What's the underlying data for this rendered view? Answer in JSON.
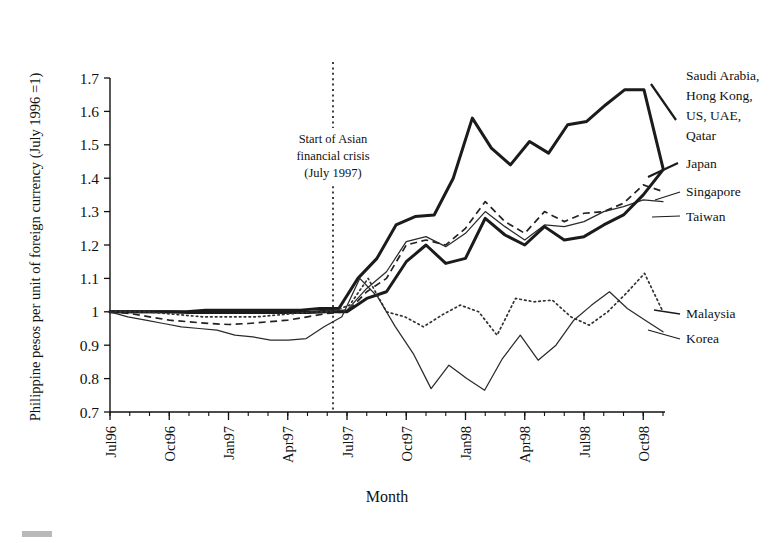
{
  "chart_data": {
    "type": "line",
    "title": "",
    "xlabel": "Month",
    "ylabel": "Philippine pesos per unit of foreign currency (July 1996 =1)",
    "ylim": [
      0.7,
      1.7
    ],
    "ytick_labels": [
      "0.7",
      "0.8",
      "0.9",
      "1",
      "1.1",
      "1.2",
      "1.3",
      "1.4",
      "1.5",
      "1.6",
      "1.7"
    ],
    "ytick_values": [
      0.7,
      0.8,
      0.9,
      1.0,
      1.1,
      1.2,
      1.3,
      1.4,
      1.5,
      1.6,
      1.7
    ],
    "xtick_labels": [
      "Jul96",
      "Oct96",
      "Jan97",
      "Apr97",
      "Jul97",
      "Oct97",
      "Jan98",
      "Apr98",
      "Jul98",
      "Oct98"
    ],
    "xtick_indices": [
      0,
      3,
      6,
      9,
      12,
      15,
      18,
      21,
      24,
      27
    ],
    "x_count": 28,
    "grid": false,
    "legend_position": "right-inline",
    "annotations": [
      {
        "name": "crisis-marker",
        "lines": [
          "Start of Asian",
          "financial crisis",
          "(July 1997)"
        ],
        "x_index": 11.7,
        "style": "vertical-dotted-line"
      }
    ],
    "series": [
      {
        "name": "Saudi Arabia, Hong Kong, US, UAE, Qatar",
        "label_lines": [
          "Saudi Arabia,",
          "Hong Kong,",
          "US, UAE,",
          "Qatar"
        ],
        "style": "thick-solid",
        "values": [
          1.0,
          1.0,
          1.0,
          1.0,
          1.0,
          1.005,
          1.005,
          1.005,
          1.005,
          1.005,
          1.005,
          1.01,
          1.01,
          1.1,
          1.16,
          1.26,
          1.285,
          1.29,
          1.4,
          1.58,
          1.49,
          1.44,
          1.51,
          1.475,
          1.56,
          1.57,
          1.62,
          1.665,
          1.665,
          1.43
        ]
      },
      {
        "name": "Japan",
        "label_lines": [
          "Japan"
        ],
        "style": "dashed",
        "values": [
          1.0,
          0.995,
          0.985,
          0.975,
          0.97,
          0.965,
          0.962,
          0.965,
          0.97,
          0.975,
          0.985,
          0.995,
          1.0,
          1.06,
          1.1,
          1.2,
          1.215,
          1.2,
          1.25,
          1.33,
          1.27,
          1.235,
          1.3,
          1.27,
          1.295,
          1.3,
          1.325,
          1.38,
          1.36
        ]
      },
      {
        "name": "Singapore",
        "label_lines": [
          "Singapore"
        ],
        "style": "thin-solid",
        "values": [
          1.0,
          1.0,
          1.0,
          1.0,
          1.0,
          1.0,
          1.0,
          1.0,
          1.0,
          1.0,
          1.0,
          1.005,
          1.005,
          1.07,
          1.12,
          1.21,
          1.225,
          1.195,
          1.235,
          1.3,
          1.255,
          1.215,
          1.26,
          1.255,
          1.27,
          1.3,
          1.315,
          1.335,
          1.33
        ]
      },
      {
        "name": "Taiwan",
        "label_lines": [
          "Taiwan"
        ],
        "style": "thick-solid",
        "values": [
          1.0,
          1.0,
          1.0,
          1.0,
          0.998,
          0.998,
          0.998,
          0.998,
          0.998,
          0.998,
          0.998,
          1.0,
          1.0,
          1.04,
          1.06,
          1.15,
          1.2,
          1.145,
          1.16,
          1.28,
          1.23,
          1.2,
          1.255,
          1.215,
          1.225,
          1.26,
          1.29,
          1.35,
          1.425
        ]
      },
      {
        "name": "Malaysia",
        "label_lines": [
          "Malaysia"
        ],
        "style": "dotted",
        "values": [
          1.0,
          1.0,
          1.0,
          0.995,
          0.99,
          0.985,
          0.985,
          0.985,
          0.985,
          0.99,
          0.995,
          1.0,
          1.0,
          1.02,
          1.1,
          1.0,
          0.985,
          0.955,
          0.99,
          1.02,
          1.0,
          0.93,
          1.04,
          1.03,
          1.035,
          0.985,
          0.96,
          1.0,
          1.055,
          1.115,
          1.0
        ]
      },
      {
        "name": "Korea",
        "label_lines": [
          "Korea"
        ],
        "style": "thin-solid",
        "values": [
          1.0,
          0.985,
          0.975,
          0.965,
          0.955,
          0.95,
          0.945,
          0.93,
          0.925,
          0.915,
          0.915,
          0.92,
          0.955,
          0.985,
          1.1,
          1.045,
          0.955,
          0.875,
          0.77,
          0.84,
          0.8,
          0.765,
          0.86,
          0.93,
          0.855,
          0.9,
          0.975,
          1.02,
          1.06,
          1.01,
          0.975,
          0.94
        ]
      }
    ]
  },
  "legend": {
    "groups": [
      {
        "name": "legend-saudi-group",
        "lines": [
          "Saudi Arabia,",
          "Hong Kong,",
          "US, UAE,",
          "Qatar"
        ]
      },
      {
        "name": "legend-japan",
        "lines": [
          "Japan"
        ]
      },
      {
        "name": "legend-singapore",
        "lines": [
          "Singapore"
        ]
      },
      {
        "name": "legend-taiwan",
        "lines": [
          "Taiwan"
        ]
      },
      {
        "name": "legend-malaysia",
        "lines": [
          "Malaysia"
        ]
      },
      {
        "name": "legend-korea",
        "lines": [
          "Korea"
        ]
      }
    ]
  },
  "colors": {
    "ink": "#1a1a1a",
    "background": "#ffffff",
    "artifact": "#b9b9b9"
  }
}
